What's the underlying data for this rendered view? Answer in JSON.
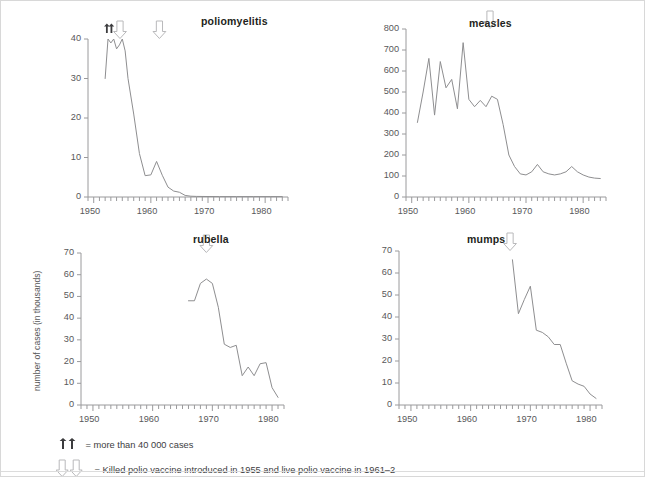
{
  "figure": {
    "y_axis_label": "number of cases (in thousands)",
    "line_color": "#8e8e90",
    "axis_color": "#9a9a9c",
    "text_color": "#58585a",
    "title_color": "#231f20",
    "border_color": "#d8d8d8",
    "background": "#ffffff"
  },
  "notes": [
    {
      "id": "note-more-than",
      "marker": "up-arrows",
      "text": "= more than 40 000 cases"
    },
    {
      "id": "note-vaccine",
      "marker": "down-arrows",
      "text": "= Killed polio vaccine introduced in 1955 and live polio vaccine in 1961–2"
    }
  ],
  "chart_data": [
    {
      "id": "poliomyelitis",
      "type": "line",
      "title": "poliomyelitis",
      "xlabel": "",
      "ylabel": "number of cases (in thousands)",
      "xlim": [
        1949,
        1984
      ],
      "ylim": [
        0,
        40
      ],
      "yticks": [
        0,
        10,
        20,
        30,
        40
      ],
      "xticks": [
        1950,
        1960,
        1970,
        1980
      ],
      "xtick_labels": [
        "1950",
        "1960",
        "1970",
        "1980"
      ],
      "ytick_labels": [
        "0",
        "10",
        "20",
        "30",
        "40"
      ],
      "grid": false,
      "legend": "none",
      "annotations": [
        {
          "name": "more-than-40000-marker-a",
          "type": "solid-up-arrow",
          "x": 1952.3
        },
        {
          "name": "more-than-40000-marker-b",
          "type": "solid-up-arrow",
          "x": 1953.1
        },
        {
          "name": "killed-vaccine-1955-arrow",
          "type": "hollow-down-arrow",
          "x": 1954.6
        },
        {
          "name": "live-vaccine-1961-arrow",
          "type": "hollow-down-arrow",
          "x": 1961.5
        }
      ],
      "x": [
        1952,
        1952.5,
        1953,
        1953.5,
        1954,
        1954.5,
        1955,
        1955.5,
        1956,
        1957,
        1958,
        1959,
        1960,
        1961,
        1962,
        1963,
        1964,
        1965,
        1966,
        1967,
        1968,
        1970,
        1972,
        1975,
        1978,
        1981,
        1983
      ],
      "values": [
        30,
        40,
        39,
        40,
        37.5,
        38.5,
        40,
        37,
        30,
        21,
        11,
        5.4,
        5.6,
        9,
        5.5,
        2.5,
        1.5,
        1.2,
        0.4,
        0.2,
        0.15,
        0.12,
        0.1,
        0.1,
        0.1,
        0.1,
        0.1
      ]
    },
    {
      "id": "measles",
      "type": "line",
      "title": "measles",
      "xlabel": "",
      "ylabel": "number of cases (in thousands)",
      "xlim": [
        1949,
        1984
      ],
      "ylim": [
        0,
        800
      ],
      "yticks": [
        0,
        100,
        200,
        300,
        400,
        500,
        600,
        700,
        800
      ],
      "xticks": [
        1950,
        1960,
        1970,
        1980
      ],
      "xtick_labels": [
        "1950",
        "1960",
        "1970",
        "1980"
      ],
      "ytick_labels": [
        "0",
        "100",
        "200",
        "300",
        "400",
        "500",
        "600",
        "700",
        "800"
      ],
      "grid": false,
      "legend": "none",
      "annotations": [
        {
          "name": "measles-vaccine-arrow",
          "type": "hollow-down-arrow",
          "x": 1963.7
        }
      ],
      "x": [
        1951,
        1952,
        1953,
        1954,
        1955,
        1956,
        1957,
        1958,
        1959,
        1960,
        1961,
        1962,
        1963,
        1964,
        1965,
        1966,
        1967,
        1968,
        1969,
        1970,
        1971,
        1972,
        1973,
        1974,
        1975,
        1976,
        1977,
        1978,
        1979,
        1980,
        1981,
        1982,
        1983
      ],
      "values": [
        355,
        500,
        660,
        390,
        645,
        520,
        560,
        420,
        735,
        465,
        430,
        460,
        430,
        480,
        465,
        345,
        200,
        145,
        110,
        105,
        120,
        155,
        120,
        110,
        105,
        110,
        120,
        145,
        120,
        105,
        95,
        90,
        88
      ]
    },
    {
      "id": "rubella",
      "type": "line",
      "title": "rubella",
      "xlabel": "",
      "ylabel": "number of cases (in thousands)",
      "xlim": [
        1948,
        1982
      ],
      "ylim": [
        0,
        70
      ],
      "yticks": [
        0,
        10,
        20,
        30,
        40,
        50,
        60,
        70
      ],
      "xticks": [
        1950,
        1960,
        1970,
        1980
      ],
      "xtick_labels": [
        "1950",
        "1960",
        "1970",
        "1980"
      ],
      "ytick_labels": [
        "0",
        "10",
        "20",
        "30",
        "40",
        "50",
        "60",
        "70"
      ],
      "grid": false,
      "legend": "none",
      "annotations": [
        {
          "name": "rubella-vaccine-arrow",
          "type": "hollow-down-arrow",
          "x": 1969.0
        }
      ],
      "x": [
        1966,
        1967,
        1968,
        1969,
        1970,
        1971,
        1972,
        1973,
        1974,
        1975,
        1976,
        1977,
        1978,
        1979,
        1980,
        1981
      ],
      "values": [
        48,
        48,
        56,
        58,
        56,
        45,
        28,
        26.5,
        27.5,
        13.5,
        17.5,
        13.5,
        19,
        19.5,
        8,
        3.5
      ]
    },
    {
      "id": "mumps",
      "type": "line",
      "title": "mumps",
      "xlabel": "",
      "ylabel": "number of cases (in thousands)",
      "xlim": [
        1948,
        1982
      ],
      "ylim": [
        0,
        70
      ],
      "yticks": [
        0,
        10,
        20,
        30,
        40,
        50,
        60,
        70
      ],
      "xticks": [
        1950,
        1960,
        1970,
        1980
      ],
      "xtick_labels": [
        "1950",
        "1960",
        "1970",
        "1980"
      ],
      "ytick_labels": [
        "0",
        "10",
        "20",
        "30",
        "40",
        "50",
        "60",
        "70"
      ],
      "grid": false,
      "legend": "none",
      "annotations": [
        {
          "name": "mumps-vaccine-arrow",
          "type": "hollow-down-arrow",
          "x": 1966.6
        }
      ],
      "x": [
        1967,
        1968,
        1969,
        1970,
        1971,
        1972,
        1973,
        1974,
        1975,
        1976,
        1977,
        1978,
        1979,
        1980,
        1981
      ],
      "values": [
        66,
        41.5,
        48,
        54,
        34,
        33,
        31,
        27.5,
        27.5,
        19,
        11,
        9.5,
        8.5,
        5,
        3
      ]
    }
  ]
}
